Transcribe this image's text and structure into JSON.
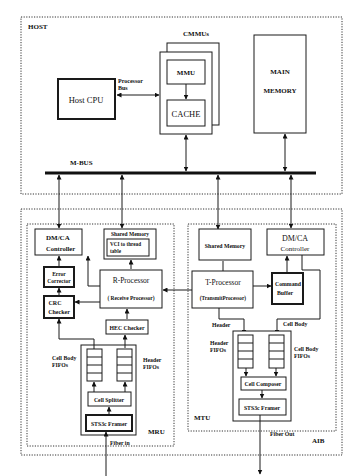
{
  "diagram": {
    "regions": {
      "host": "HOST",
      "aib": "AIB",
      "mru": "MRU",
      "mtu": "MTU"
    },
    "host": {
      "cmmus_label": "CMMUs",
      "host_cpu": "Host CPU",
      "processor_bus_line1": "Processor",
      "processor_bus_line2": "Bus",
      "mmu": "MMU",
      "cache": "CACHE",
      "main_memory_line1": "MAIN",
      "main_memory_line2": "MEMORY",
      "mbus": "M-BUS"
    },
    "mru": {
      "dmca_line1": "DM/CA",
      "dmca_line2": "Controller",
      "shared_memory": "Shared Memory",
      "vci_line1": "VCI to thread",
      "vci_line2": "table",
      "error_line1": "Error",
      "error_line2": "Corrector",
      "crc_line1": "CRC",
      "crc_line2": "Checker",
      "rproc_line1": "R-Processor",
      "rproc_line2": "( Receive Processor)",
      "hec_checker": "HEC Checker",
      "cellbody_fifos_line1": "Cell Body",
      "cellbody_fifos_line2": "FIFOs",
      "header_fifos_line1": "Header",
      "header_fifos_line2": "FIFOs",
      "cell_splitter": "Cell Splitter",
      "sts3c_framer": "STS3c Framer",
      "fiber_in": "Fiber in"
    },
    "mtu": {
      "shared_memory": "Shared Memory",
      "dmca_line1": "DM/CA",
      "dmca_line2": "Controller",
      "tproc_line1": "T-Processor",
      "tproc_line2": "(TransmitProcessor)",
      "command_line1": "Command",
      "command_line2": "Buffer",
      "header": "Header",
      "cell_body": "Cell Body",
      "header_fifos_line1": "Header",
      "header_fifos_line2": "FIFOs",
      "cellbody_fifos_line1": "Cell Body",
      "cellbody_fifos_line2": "FIFOs",
      "cell_composer": "Cell Composer",
      "sts3c_framer": "STS3c Framer",
      "fiber_out": "Fiber Out"
    }
  }
}
